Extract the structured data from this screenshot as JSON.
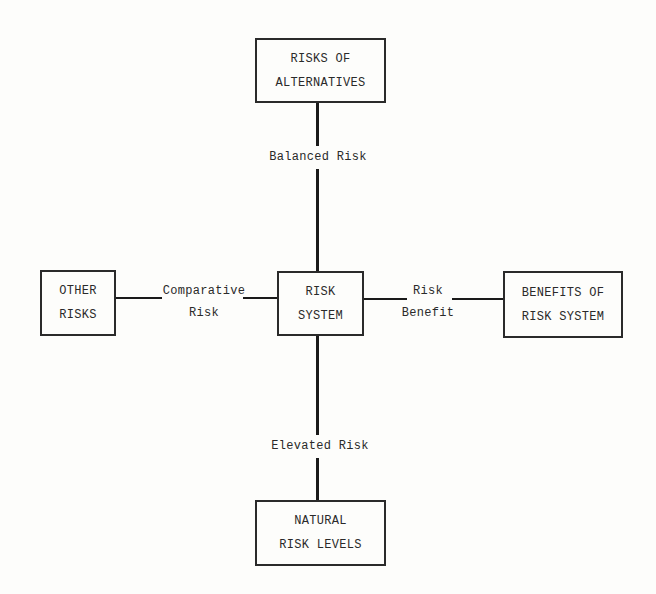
{
  "diagram": {
    "nodes": {
      "top": {
        "lines": [
          "RISKS OF",
          "ALTERNATIVES"
        ]
      },
      "left": {
        "lines": [
          "OTHER",
          "RISKS"
        ]
      },
      "center": {
        "lines": [
          "RISK",
          "SYSTEM"
        ]
      },
      "right": {
        "lines": [
          "BENEFITS OF",
          "RISK SYSTEM"
        ]
      },
      "bottom": {
        "lines": [
          "NATURAL",
          "RISK LEVELS"
        ]
      }
    },
    "edges": {
      "top": {
        "lines": [
          "Balanced Risk"
        ]
      },
      "left": {
        "lines": [
          "Comparative",
          "Risk"
        ]
      },
      "right": {
        "lines": [
          "Risk",
          "Benefit"
        ]
      },
      "bottom": {
        "lines": [
          "Elevated Risk"
        ]
      }
    }
  }
}
